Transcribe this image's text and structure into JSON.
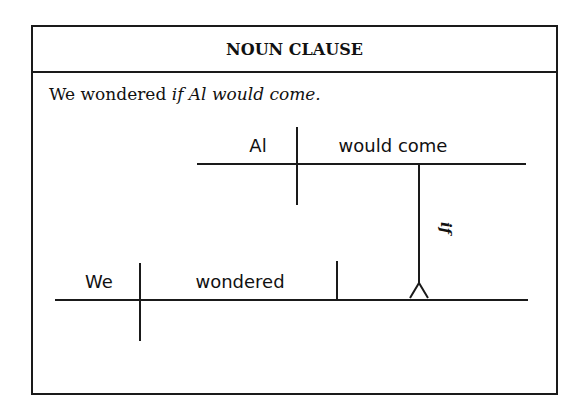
{
  "title": "NOUN CLAUSE",
  "sentence": {
    "main": "We wondered ",
    "clause": "if Al would come.",
    "full": "We wondered if Al would come."
  },
  "diagram": {
    "main_clause": {
      "subject": "We",
      "verb": "wondered"
    },
    "noun_clause": {
      "subject": "Al",
      "verb": "would come",
      "connector": "if",
      "role": "direct object"
    }
  }
}
